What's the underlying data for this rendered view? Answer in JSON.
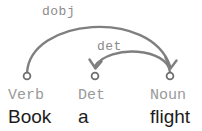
{
  "diagram": {
    "type": "dependency-parse",
    "sentence": "Book a flight",
    "canvas": {
      "width": 202,
      "height": 131,
      "background": "#ffffff"
    },
    "colors": {
      "arc": "#7f7f7f",
      "arc_label": "#8c8c8c",
      "pos_tag": "#9a9a9a",
      "word": "#1c1c1c",
      "node_stroke": "#6e6e6e"
    },
    "nodes": [
      {
        "id": "n0",
        "index": 0,
        "word": "Book",
        "pos": "Verb",
        "x": 27,
        "y": 76
      },
      {
        "id": "n1",
        "index": 1,
        "word": "a",
        "pos": "Det",
        "x": 95,
        "y": 76
      },
      {
        "id": "n2",
        "index": 2,
        "word": "flight",
        "pos": "Noun",
        "x": 170,
        "y": 76
      }
    ],
    "arcs": [
      {
        "id": "a0",
        "label": "dobj",
        "head": "n0",
        "dependent": "n2",
        "direction": "left-to-right",
        "label_x": 42,
        "label_y": 15,
        "path": "M 27 73 C 30 18, 150 8, 170 66",
        "arrow": "M 165.5 57.5 L 170.5 68.5 L 176.5 60.5"
      },
      {
        "id": "a1",
        "label": "det",
        "head": "n2",
        "dependent": "n1",
        "direction": "right-to-left",
        "label_x": 97,
        "label_y": 50,
        "path": "M 170 72 C 168 48, 110 44, 95 66",
        "arrow": "M 89.5 59.5 L 95.5 68.5 L 101.5 61.5"
      }
    ],
    "pos_labels": [
      {
        "text": "Verb",
        "x": 8,
        "y": 99
      },
      {
        "text": "Det",
        "x": 78,
        "y": 99
      },
      {
        "text": "Noun",
        "x": 150,
        "y": 99
      }
    ],
    "word_labels": [
      {
        "text": "Book",
        "x": 8,
        "y": 123
      },
      {
        "text": "a",
        "x": 78,
        "y": 123
      },
      {
        "text": "flight",
        "x": 150,
        "y": 123
      }
    ]
  }
}
